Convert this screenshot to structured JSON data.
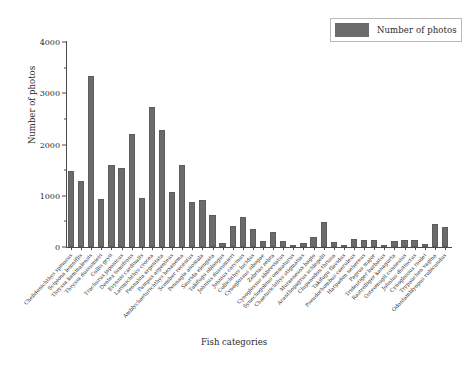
{
  "legend": {
    "label": "Number of photos",
    "swatch_color": "#6b6b6b",
    "position": "upper-right"
  },
  "axes": {
    "ylabel": "Number of photos",
    "xlabel": "Fish categories",
    "yticks": [
      "0",
      "1000",
      "2000",
      "3000",
      "4000"
    ],
    "ytick_values": [
      0,
      1000,
      2000,
      3000,
      4000
    ],
    "ylim": [
      0,
      4000
    ],
    "grid": false
  },
  "chart_data": {
    "type": "bar",
    "title": "",
    "xlabel": "Fish categories",
    "ylabel": "Number of photos",
    "ylim": [
      0,
      4000
    ],
    "grid": false,
    "legend_position": "upper right",
    "series_name": "Number of photos",
    "bar_color": "#6b6b6b",
    "categories": [
      "Chelidonichthys spinosus",
      "Scipiona lemniflis",
      "Thryssa kammalensis",
      "Thryssa dussumieri",
      "Collis gryii",
      "Trachurus japonicus",
      "Dentex tumifrons",
      "Evynnis cardinalis",
      "Larimichthys crocea",
      "Pennahia argentata",
      "Pampus argenteus",
      "Amblychaeturichthys hexanema",
      "Scomber recentus",
      "Pennagia anomala",
      "Saurida elongata",
      "Takifugu oblongus",
      "Johnius dussumieri",
      "Johnius carcinus",
      "Collichthys lucidus",
      "Cynoglossus sibogae",
      "Zebrias zebra",
      "Cynoglossus abbreviatus",
      "Synechogobius ommaturus",
      "Chaeturichthys stigmatias",
      "Muraenesox bagio",
      "Acanthopagrus schlegelii",
      "Clupanodon thrissa",
      "Takifugu flavidus",
      "Pseudorhombus caeruleus",
      "Harpadon nehereus",
      "Pagrus major",
      "Trideutiger barbatus",
      "Rastrelliger kanagurta",
      "Osteomugil cunnesius",
      "Johnius distinctus",
      "Cynoglossus roulei",
      "Trypauchen vagina",
      "Odontamblyopus rubicundus"
    ],
    "values": [
      1490,
      1290,
      3340,
      930,
      1600,
      1550,
      2200,
      960,
      2730,
      2290,
      1080,
      1610,
      880,
      910,
      630,
      70,
      410,
      580,
      360,
      110,
      300,
      110,
      30,
      80,
      200,
      480,
      95,
      35,
      165,
      145,
      145,
      35,
      120,
      135,
      140,
      55,
      440,
      390
    ]
  }
}
